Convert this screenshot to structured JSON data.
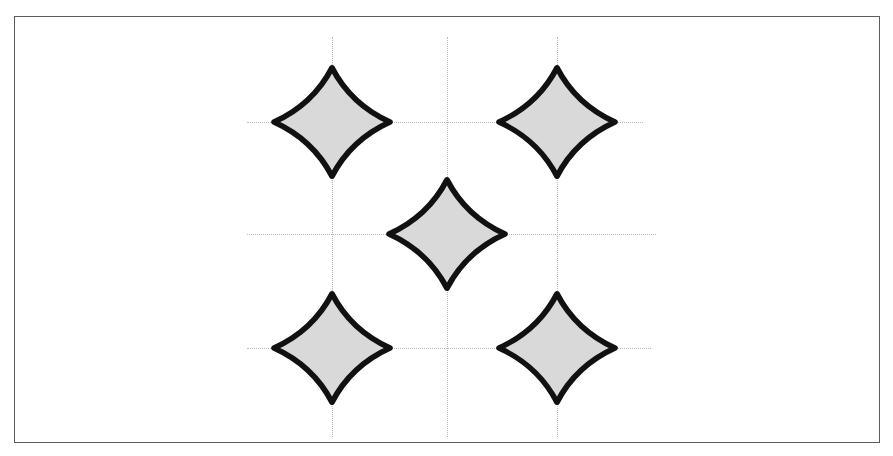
{
  "figure": {
    "title": "Quincunx arrangement of five four-pointed concave stars",
    "caption": "",
    "background_color": "#ffffff",
    "frame": {
      "x": 14,
      "y": 16,
      "width": 866,
      "height": 427,
      "stroke_color": "#5c5c5c",
      "stroke_width": 1,
      "visible": true
    }
  },
  "chart_data": {
    "type": "scatter",
    "title": "Quincunx arrangement of five four-pointed concave stars",
    "xlabel": "",
    "ylabel": "",
    "xlim": [
      14,
      880
    ],
    "ylim": [
      16,
      443
    ],
    "grid": true,
    "legend": null,
    "marker": {
      "shape": "four-pointed-concave-star",
      "fill_color": "#d9d9d9",
      "stroke_color": "#111111",
      "stroke_width": 9,
      "width": 126,
      "height": 118
    },
    "points": [
      {
        "label": "top-left-star",
        "x": 332,
        "y": 122
      },
      {
        "label": "top-right-star",
        "x": 557,
        "y": 122
      },
      {
        "label": "center-star",
        "x": 447,
        "y": 234
      },
      {
        "label": "bottom-left-star",
        "x": 332,
        "y": 348
      },
      {
        "label": "bottom-right-star",
        "x": 557,
        "y": 348
      }
    ],
    "gridlines": {
      "color": "#b9b9b9",
      "style": "dotted",
      "width": 1,
      "horizontal": [
        {
          "label": "grid-row-top",
          "y": 122,
          "x_start": 247,
          "x_end": 643
        },
        {
          "label": "grid-row-middle",
          "y": 234,
          "x_start": 247,
          "x_end": 656
        },
        {
          "label": "grid-row-bottom",
          "y": 348,
          "x_start": 247,
          "x_end": 651
        }
      ],
      "vertical": [
        {
          "label": "grid-col-left",
          "x": 332,
          "y_start": 37,
          "y_end": 437
        },
        {
          "label": "grid-col-center",
          "x": 447,
          "y_start": 37,
          "y_end": 437
        },
        {
          "label": "grid-col-right",
          "x": 557,
          "y_start": 37,
          "y_end": 437
        }
      ]
    }
  }
}
